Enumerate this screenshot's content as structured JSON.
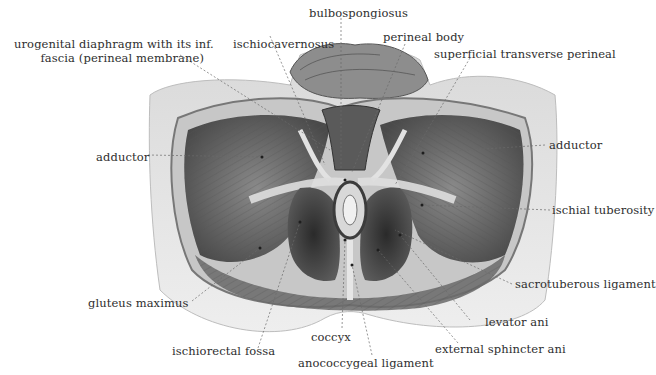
{
  "figure": {
    "colors": {
      "background": "#ffffff",
      "skin": "#e6e6e6",
      "muscle_dark": "#3a3a3a",
      "muscle_mid": "#7a7a7a",
      "fascia_light": "#d0d0d0",
      "label_text": "#2e2e2e",
      "leader_line": "#6a6a6a"
    },
    "labels": {
      "bulbospongiosus": "bulbospongiosus",
      "urogenital_line1": "urogenital diaphragm with its inf.",
      "urogenital_line2": "fascia (perineal membrane)",
      "ischiocavernosus": "ischiocavernosus",
      "perineal_body": "perineal body",
      "superficial_transverse_perineal": "superficial transverse perineal",
      "adductor_left": "adductor",
      "adductor_right": "adductor",
      "ischial_tuberosity": "ischial tuberosity",
      "sacrotuberous_ligament": "sacrotuberous ligament",
      "gluteus_maximus": "gluteus maximus",
      "levator_ani": "levator ani",
      "coccyx": "coccyx",
      "ischiorectal_fossa": "ischiorectal fossa",
      "external_sphincter_ani": "external sphincter ani",
      "anococcygeal_ligament": "anococcygeal ligament"
    }
  }
}
